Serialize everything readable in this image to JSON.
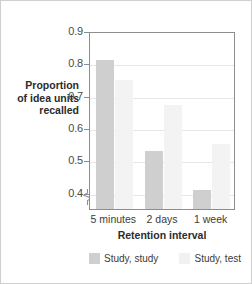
{
  "chart_data": {
    "type": "bar",
    "title": "",
    "categories": [
      "5 minutes",
      "2 days",
      "1 week"
    ],
    "series": [
      {
        "name": "Study, study",
        "values": [
          0.81,
          0.53,
          0.41
        ],
        "color": "#cfcfcf"
      },
      {
        "name": "Study, test",
        "values": [
          0.75,
          0.67,
          0.55
        ],
        "color": "#f3f3f3"
      }
    ],
    "xlabel": "Retention interval",
    "ylabel": "Proportion of idea units recalled",
    "ylim": [
      0.35,
      0.9
    ],
    "yticks": [
      0.4,
      0.5,
      0.6,
      0.7,
      0.8,
      0.9
    ],
    "ytick_labels": [
      "0.4",
      "0.5",
      "0.6",
      "0.7",
      "0.8",
      "0.9"
    ],
    "axis_break": true,
    "grid": true,
    "legend_position": "bottom"
  },
  "axis": {
    "y_title_line1": "Proportion",
    "y_title_line2": "of idea units",
    "y_title_line3": "recalled",
    "x_title": "Retention interval",
    "ticks": [
      "0.9",
      "0.8",
      "0.7",
      "0.6",
      "0.5",
      "0.4"
    ]
  },
  "categories": {
    "c0": "5 minutes",
    "c1": "2 days",
    "c2": "1 week"
  },
  "legend": {
    "items": [
      {
        "label": "Study, study"
      },
      {
        "label": "Study, test"
      }
    ]
  }
}
